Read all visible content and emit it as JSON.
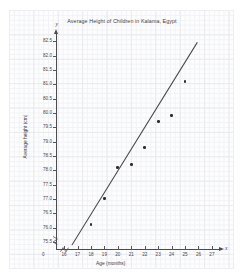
{
  "chart_data": {
    "type": "scatter",
    "title": "Average Height of Children in Kalama, Egypt",
    "xlabel": "Age (months)",
    "ylabel": "Average height (cm)",
    "xlim": [
      15.4,
      27.6
    ],
    "ylim": [
      75.25,
      82.75
    ],
    "xticks": [
      16,
      17,
      18,
      19,
      20,
      21,
      22,
      23,
      24,
      25,
      26,
      27
    ],
    "yticks": [
      75.5,
      76.0,
      76.5,
      77.0,
      77.5,
      78.0,
      78.5,
      79.0,
      79.5,
      80.0,
      80.5,
      81.0,
      81.5,
      82.0,
      82.5
    ],
    "xtick_labels": [
      "16",
      "17",
      "18",
      "19",
      "20",
      "21",
      "22",
      "23",
      "24",
      "25",
      "26",
      "27"
    ],
    "ytick_labels": [
      "75.5",
      "76.0",
      "76.5",
      "77.0",
      "77.5",
      "78.0",
      "78.5",
      "79.0",
      "79.5",
      "80.0",
      "80.5",
      "81.0",
      "81.5",
      "82.0",
      "82.5"
    ],
    "origin_label": "0",
    "x_axis_letter": "x",
    "y_axis_letter": "y",
    "grid": true,
    "grid_style": "graph-paper",
    "legend": "none",
    "axis_break": true,
    "marker_color": "#2c2c32",
    "line_color": "#4a4a50",
    "points": [
      {
        "x": 18,
        "y": 76.1
      },
      {
        "x": 19,
        "y": 77.0
      },
      {
        "x": 20,
        "y": 78.1
      },
      {
        "x": 21,
        "y": 78.2
      },
      {
        "x": 22,
        "y": 78.8
      },
      {
        "x": 23,
        "y": 79.7
      },
      {
        "x": 24,
        "y": 79.9
      },
      {
        "x": 25,
        "y": 81.1
      }
    ],
    "trend_line": {
      "type": "line",
      "label": "line of best fit",
      "x_start": 16.6,
      "y_start": 75.4,
      "x_end": 25.9,
      "y_end": 82.45
    }
  }
}
